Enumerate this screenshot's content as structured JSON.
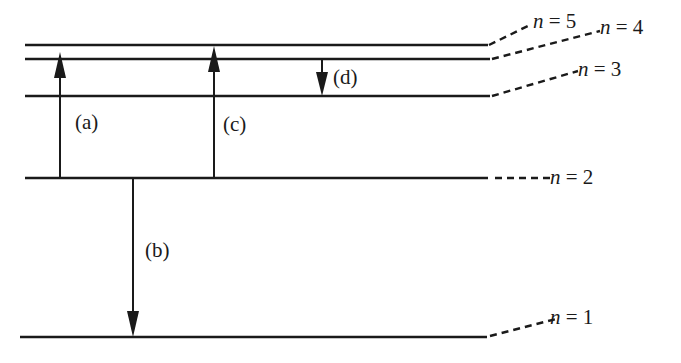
{
  "diagram": {
    "title": "",
    "type": "energy-level-diagram",
    "levels": [
      {
        "n": 5,
        "label": "n = 5",
        "var": "n",
        "eq": " = 5"
      },
      {
        "n": 4,
        "label": "n = 4",
        "var": "n",
        "eq": " = 4"
      },
      {
        "n": 3,
        "label": "n = 3",
        "var": "n",
        "eq": " = 3"
      },
      {
        "n": 2,
        "label": "n = 2",
        "var": "n",
        "eq": " = 2"
      },
      {
        "n": 1,
        "label": "n = 1",
        "var": "n",
        "eq": " = 1"
      }
    ],
    "transitions": [
      {
        "id": "a",
        "label": "(a)",
        "from": 2,
        "to": 4,
        "direction": "up"
      },
      {
        "id": "b",
        "label": "(b)",
        "from": 2,
        "to": 1,
        "direction": "down"
      },
      {
        "id": "c",
        "label": "(c)",
        "from": 2,
        "to": 5,
        "direction": "up"
      },
      {
        "id": "d",
        "label": "(d)",
        "from": 4,
        "to": 3,
        "direction": "down"
      }
    ],
    "colors": {
      "line": "#1a1a1a",
      "background": "#ffffff"
    }
  }
}
